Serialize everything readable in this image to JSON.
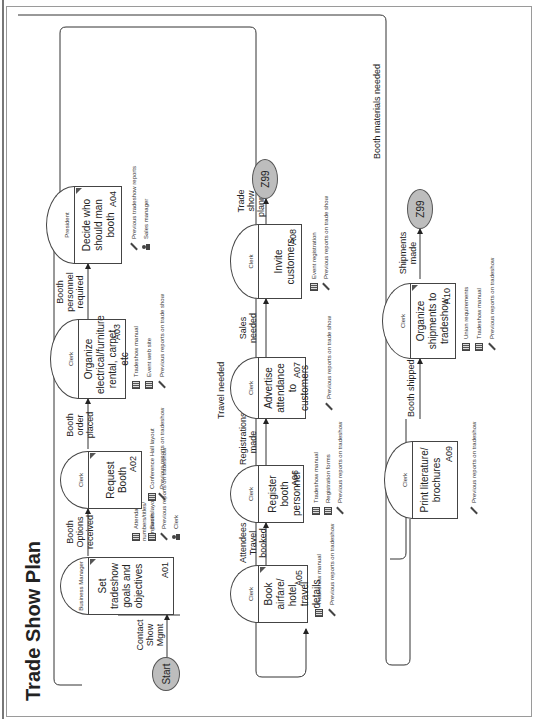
{
  "diagram": {
    "title": "Trade Show Plan",
    "start_node": "Start",
    "end_nodes": [
      {
        "id": "end-1",
        "label": "Z99"
      },
      {
        "id": "end-2",
        "label": "Z99"
      }
    ],
    "activities": [
      {
        "code": "A01",
        "role": "Business Manager",
        "label": "Set tradeshow goals and objectives",
        "resources": [
          {
            "type": "document",
            "text": "Attendance numbers/titles/ companies"
          },
          {
            "type": "document",
            "text": "Booth layout"
          },
          {
            "type": "tool",
            "text": "Previous reports on tradeshow"
          },
          {
            "type": "person",
            "text": "Clerk"
          }
        ]
      },
      {
        "code": "A02",
        "role": "Clerk",
        "label": "Request Booth",
        "resources": [
          {
            "type": "document",
            "text": "Conference Hall layout"
          },
          {
            "type": "tool",
            "text": "Previous reports on tradeshow"
          }
        ]
      },
      {
        "code": "A03",
        "role": "Clerk",
        "label": "Organize electrical/furniture rental, carpet etc",
        "resources": [
          {
            "type": "document",
            "text": "Tradeshow manual"
          },
          {
            "type": "document",
            "text": "Event web site"
          },
          {
            "type": "tool",
            "text": "Previous reports on trade show"
          }
        ]
      },
      {
        "code": "A04",
        "role": "President",
        "label": "Decide who should man booth",
        "resources": [
          {
            "type": "tool",
            "text": "Previous tradeshow reports"
          },
          {
            "type": "person",
            "text": "Sales manager"
          }
        ]
      },
      {
        "code": "A05",
        "role": "Clerk",
        "label": "Book airfare/ hotel, travel details",
        "resources": [
          {
            "type": "document",
            "text": "Tradeshow manual"
          },
          {
            "type": "tool",
            "text": "Previous reports on tradeshow"
          }
        ]
      },
      {
        "code": "A06",
        "role": "Clerk",
        "label": "Register booth personnel",
        "resources": [
          {
            "type": "document",
            "text": "Tradeshow manual"
          },
          {
            "type": "document",
            "text": "Registration forms"
          },
          {
            "type": "tool",
            "text": "Previous reports on tradeshow"
          }
        ]
      },
      {
        "code": "A07",
        "role": "Clerk",
        "label": "Advertise attendance to customers",
        "resources": [
          {
            "type": "tool",
            "text": "Previous reports on trade show"
          }
        ]
      },
      {
        "code": "A08",
        "role": "Clerk",
        "label": "Invite customers",
        "resources": [
          {
            "type": "document",
            "text": "Event registration"
          },
          {
            "type": "tool",
            "text": "Previous reports on trade show"
          }
        ]
      },
      {
        "code": "A09",
        "role": "Clerk",
        "label": "Print literature/ brochures",
        "resources": [
          {
            "type": "tool",
            "text": "Previous reports on tradeshow"
          }
        ]
      },
      {
        "code": "A10",
        "role": "Clerk",
        "label": "Organize shipments to tradeshow",
        "resources": [
          {
            "type": "document",
            "text": "Union requirements"
          },
          {
            "type": "document",
            "text": "Tradeshow manual"
          },
          {
            "type": "tool",
            "text": "Previous reports on tradeshow"
          }
        ]
      }
    ],
    "flows": [
      {
        "from": "Start",
        "to": "A01",
        "label": "Contact Show Mgmt"
      },
      {
        "from": "A01",
        "to": "A02",
        "label": "Booth Options received"
      },
      {
        "from": "A02",
        "to": "A03",
        "label": "Booth order placed"
      },
      {
        "from": "A03",
        "to": "A04",
        "label": "Booth personnel required"
      },
      {
        "from": "A04",
        "to": "A05",
        "label": "Travel needed"
      },
      {
        "from": "A05",
        "to": "A06",
        "label": "Attendees Travel booked"
      },
      {
        "from": "A06",
        "to": "A07",
        "label": "Registrations made"
      },
      {
        "from": "A07",
        "to": "A08",
        "label": "Sales needed"
      },
      {
        "from": "A08",
        "to": "Z99",
        "label": "Trade show planned"
      },
      {
        "from": "A04",
        "to": "A09",
        "label": "Booth materials needed"
      },
      {
        "from": "A09",
        "to": "A10",
        "label": "Booth shipped"
      },
      {
        "from": "A10",
        "to": "Z99",
        "label": "Shipments made"
      }
    ]
  }
}
